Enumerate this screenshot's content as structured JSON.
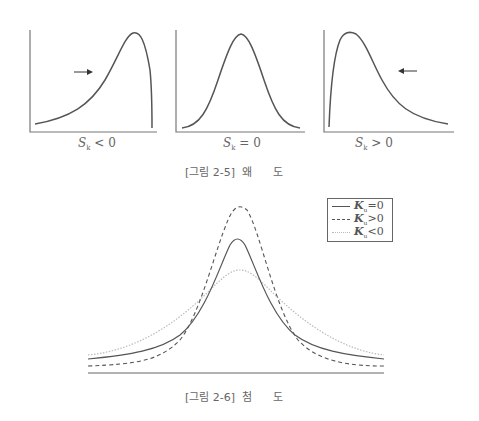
{
  "figure_2_5": {
    "caption": "[그림 2-5]  왜      도",
    "panels": [
      {
        "label_var": "S",
        "label_sub": "k",
        "label_rel": " < 0",
        "description": "negatively skewed (left tail), arrow pointing right"
      },
      {
        "label_var": "S",
        "label_sub": "k",
        "label_rel": " = 0",
        "description": "symmetric"
      },
      {
        "label_var": "S",
        "label_sub": "k",
        "label_rel": " > 0",
        "description": "positively skewed (right tail), arrow pointing left"
      }
    ]
  },
  "figure_2_6": {
    "caption": "[그림 2-6]  첨      도",
    "legend": [
      {
        "var": "K",
        "sub": "u",
        "rel": "=0",
        "style": "solid"
      },
      {
        "var": "K",
        "sub": "u",
        "rel": ">0",
        "style": "dashed"
      },
      {
        "var": "K",
        "sub": "u",
        "rel": "<0",
        "style": "dotted"
      }
    ]
  },
  "colors": {
    "curve": "#555555",
    "axis": "#666666",
    "light_curve": "#bbbbbb"
  }
}
